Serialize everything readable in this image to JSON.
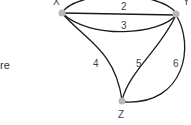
{
  "side_text": "re",
  "graph": {
    "nodes": [
      {
        "id": "X",
        "label": "X"
      },
      {
        "id": "Y",
        "label": "Y"
      },
      {
        "id": "Z",
        "label": "Z"
      }
    ],
    "edges": [
      {
        "id": "e1",
        "from": "X",
        "to": "Y",
        "label": "1"
      },
      {
        "id": "e2",
        "from": "X",
        "to": "Y",
        "label": "2"
      },
      {
        "id": "e3",
        "from": "X",
        "to": "Y",
        "label": "3"
      },
      {
        "id": "e4",
        "from": "X",
        "to": "Z",
        "label": "4"
      },
      {
        "id": "e5",
        "from": "Y",
        "to": "Z",
        "label": "5"
      },
      {
        "id": "e6",
        "from": "Y",
        "to": "Z",
        "label": "6"
      }
    ]
  },
  "colors": {
    "edge": "#1a1a1a",
    "node": "#b8b8b8",
    "label": "#444444"
  }
}
